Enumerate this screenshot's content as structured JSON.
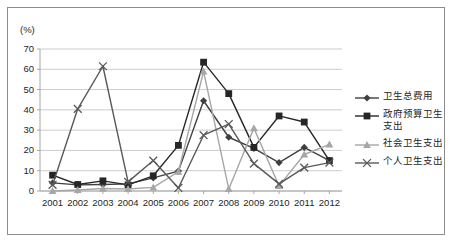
{
  "figure": {
    "unit_label": "(%)",
    "border_color": "#8c8c8c",
    "background": "#ffffff",
    "plot_border_color": "#a6a6a6",
    "gridline_color": "#bfbfbf"
  },
  "legend": {
    "position": "right",
    "items": [
      {
        "label": "卫生总费用",
        "color": "#404040",
        "marker": "diamond",
        "name": "total-health-expenditure"
      },
      {
        "label": "政府预算卫生支出",
        "color": "#262626",
        "marker": "square",
        "name": "government-budget-health-expenditure"
      },
      {
        "label": "社会卫生支出",
        "color": "#a6a6a6",
        "marker": "triangle",
        "name": "social-health-expenditure"
      },
      {
        "label": "个人卫生支出",
        "color": "#595959",
        "marker": "cross",
        "name": "personal-health-expenditure"
      }
    ]
  },
  "chart_data": {
    "type": "line",
    "title": "",
    "xlabel": "",
    "ylabel": "(%)",
    "ylim": [
      0,
      70
    ],
    "ytick_step": 10,
    "grid": true,
    "legend_position": "right",
    "categories": [
      "2001",
      "2002",
      "2003",
      "2004",
      "2005",
      "2006",
      "2007",
      "2008",
      "2009",
      "2010",
      "2011",
      "2012"
    ],
    "yticks": [
      "0",
      "10",
      "20",
      "30",
      "40",
      "50",
      "60",
      "70"
    ],
    "series": [
      {
        "name": "卫生总费用",
        "marker": "diamond",
        "color": "#404040",
        "values": [
          4.0,
          3.0,
          3.2,
          3.5,
          6.5,
          9.8,
          44.5,
          26.5,
          21.0,
          14.0,
          21.5,
          15.0
        ]
      },
      {
        "name": "政府预算卫生支出",
        "marker": "square",
        "color": "#262626",
        "values": [
          7.8,
          3.2,
          5.0,
          3.0,
          7.5,
          22.5,
          63.5,
          48.0,
          21.5,
          37.0,
          34.0,
          15.0
        ]
      },
      {
        "name": "社会卫生支出",
        "marker": "triangle",
        "color": "#a6a6a6",
        "values": [
          0.0,
          0.5,
          1.2,
          1.0,
          1.8,
          9.5,
          59.0,
          1.0,
          31.0,
          2.5,
          18.0,
          23.0
        ]
      },
      {
        "name": "个人卫生支出",
        "marker": "cross",
        "color": "#595959",
        "values": [
          3.0,
          40.5,
          61.5,
          4.5,
          15.0,
          1.5,
          27.5,
          33.0,
          13.5,
          3.5,
          11.5,
          14.0
        ]
      }
    ]
  }
}
